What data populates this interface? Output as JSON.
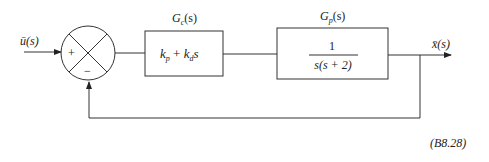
{
  "diagram": {
    "type": "feedback-control-block-diagram",
    "input_label": "ū(s)",
    "output_label": "x̄(s)",
    "summing_junction": {
      "plus_sign": "+",
      "minus_sign": "−"
    },
    "controller": {
      "name": "Gc(s)",
      "name_main": "G",
      "name_sub": "c",
      "name_arg": "(s)",
      "expr_kp": "k",
      "expr_kp_sub": "p",
      "expr_plus": " + ",
      "expr_kd": "k",
      "expr_kd_sub": "d",
      "expr_s": "s"
    },
    "plant": {
      "name": "Gp(s)",
      "name_main": "G",
      "name_sub": "p",
      "name_arg": "(s)",
      "numerator": "1",
      "denominator": "s(s + 2)"
    },
    "equation_number": "(B8.28)",
    "colors": {
      "stroke": "#333333",
      "text": "#222222",
      "background": "#ffffff"
    }
  }
}
